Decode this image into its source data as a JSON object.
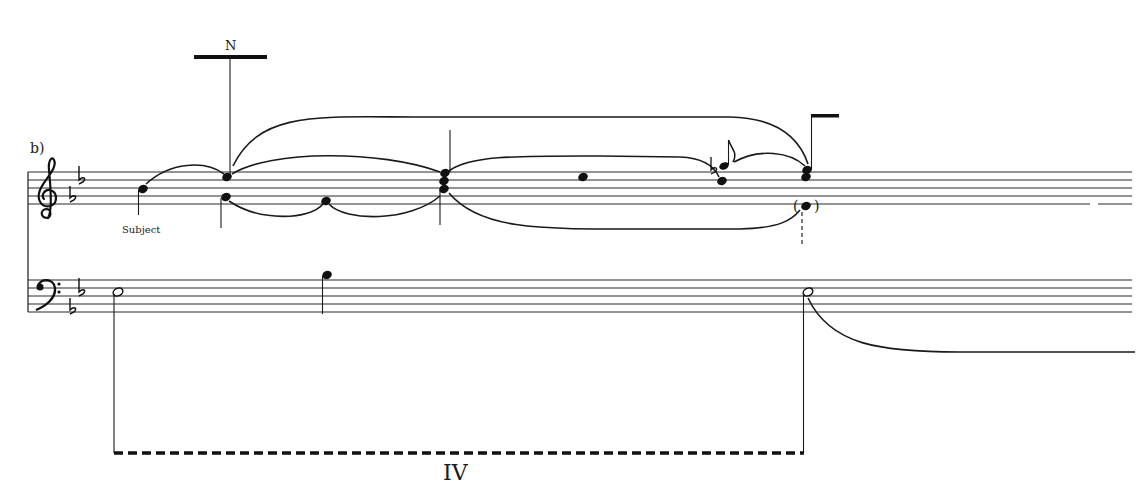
{
  "figure": {
    "part_label": "b)",
    "annotation_subject": "Subject",
    "neighbor_label": "N",
    "harmony_label": "IV"
  },
  "staves": {
    "treble": {
      "clef": "treble-clef",
      "key_signature": [
        "b-flat",
        "e-flat"
      ],
      "line_y": [
        172,
        180,
        188,
        196,
        204
      ]
    },
    "bass": {
      "clef": "bass-clef",
      "key_signature": [
        "b-flat",
        "e-flat"
      ],
      "line_y": [
        280,
        288,
        296,
        304,
        312
      ]
    }
  },
  "notes": {
    "treble": [
      {
        "x": 143,
        "desc": "subject note, stem down"
      },
      {
        "x": 227,
        "desc": "upper voice note with N stem"
      },
      {
        "x": 225,
        "desc": "lower voice note"
      },
      {
        "x": 326,
        "desc": "lower voice passing note"
      },
      {
        "x": 444,
        "desc": "three-note chord"
      },
      {
        "x": 583,
        "desc": "upper voice note"
      },
      {
        "x": 722,
        "desc": "grace note with flat, plus lower note"
      },
      {
        "x": 806,
        "desc": "two-note chord with flag stem"
      },
      {
        "x": 806,
        "desc": "parenthesized implied note"
      }
    ],
    "bass": [
      {
        "x": 117,
        "desc": "half note"
      },
      {
        "x": 326,
        "desc": "quarter note, stem down"
      },
      {
        "x": 808,
        "desc": "half note"
      }
    ]
  },
  "colors": {
    "ink": "#111111",
    "paper": "#ffffff"
  }
}
